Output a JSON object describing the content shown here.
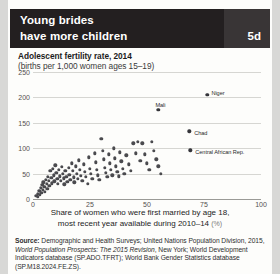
{
  "header": {
    "title": "Young brides\nhave more children",
    "badge": "5d",
    "bg_color": "#231f20",
    "badge_bg_color": "#393536"
  },
  "chart_data": {
    "type": "scatter",
    "title": "Adolescent fertility rate, 2014",
    "subtitle": "(births per 1,000 women ages 15–19)",
    "xlabel": "Share of women who were first married by age 18,",
    "xlabel_line2": "most recent year available during 2010–14",
    "xlabel_unit": "(%)",
    "ylabel": "",
    "xlim": [
      0,
      100
    ],
    "ylim": [
      0,
      250
    ],
    "xticks": [
      "0",
      "25",
      "50",
      "75",
      "100"
    ],
    "xtick_values": [
      0,
      25,
      50,
      75,
      100
    ],
    "yticks": [
      "0",
      "50",
      "100",
      "150",
      "200",
      "250"
    ],
    "ytick_values": [
      0,
      50,
      100,
      150,
      200,
      250
    ],
    "grid": true,
    "legend": "none",
    "marker_color": "#4a4a4e",
    "points": [
      [
        1.5,
        6
      ],
      [
        2.0,
        10
      ],
      [
        2.2,
        4
      ],
      [
        2.8,
        16
      ],
      [
        3.0,
        8
      ],
      [
        3.4,
        22
      ],
      [
        3.6,
        12
      ],
      [
        4.0,
        28
      ],
      [
        4.2,
        18
      ],
      [
        4.6,
        33
      ],
      [
        5.0,
        24
      ],
      [
        5.2,
        14
      ],
      [
        5.6,
        38
      ],
      [
        6.0,
        30
      ],
      [
        6.2,
        20
      ],
      [
        6.6,
        44
      ],
      [
        7.0,
        36
      ],
      [
        7.2,
        26
      ],
      [
        7.6,
        56
      ],
      [
        8.0,
        42
      ],
      [
        8.2,
        31
      ],
      [
        8.6,
        60
      ],
      [
        9.0,
        47
      ],
      [
        9.4,
        35
      ],
      [
        9.8,
        66
      ],
      [
        10.2,
        52
      ],
      [
        10.6,
        40
      ],
      [
        11.0,
        30
      ],
      [
        11.4,
        58
      ],
      [
        11.8,
        45
      ],
      [
        12.2,
        36
      ],
      [
        12.6,
        63
      ],
      [
        13.0,
        50
      ],
      [
        13.4,
        41
      ],
      [
        13.8,
        29
      ],
      [
        14.2,
        55
      ],
      [
        14.6,
        44
      ],
      [
        15.0,
        34
      ],
      [
        15.6,
        62
      ],
      [
        16.0,
        48
      ],
      [
        16.4,
        38
      ],
      [
        17.0,
        70
      ],
      [
        17.4,
        56
      ],
      [
        17.8,
        43
      ],
      [
        18.2,
        33
      ],
      [
        18.8,
        64
      ],
      [
        19.2,
        50
      ],
      [
        19.6,
        40
      ],
      [
        20.2,
        76
      ],
      [
        20.6,
        58
      ],
      [
        21.0,
        46
      ],
      [
        21.6,
        36
      ],
      [
        22.2,
        68
      ],
      [
        22.8,
        54
      ],
      [
        23.2,
        44
      ],
      [
        24.0,
        30
      ],
      [
        24.6,
        82
      ],
      [
        25.0,
        60
      ],
      [
        25.4,
        50
      ],
      [
        26.0,
        40
      ],
      [
        27.0,
        90
      ],
      [
        27.6,
        72
      ],
      [
        28.0,
        58
      ],
      [
        28.4,
        47
      ],
      [
        29.0,
        38
      ],
      [
        30.0,
        118
      ],
      [
        30.6,
        95
      ],
      [
        31.0,
        78
      ],
      [
        31.6,
        62
      ],
      [
        32.0,
        52
      ],
      [
        32.6,
        44
      ],
      [
        33.2,
        88
      ],
      [
        33.8,
        70
      ],
      [
        34.2,
        57
      ],
      [
        34.8,
        47
      ],
      [
        35.4,
        100
      ],
      [
        36.0,
        80
      ],
      [
        36.4,
        64
      ],
      [
        37.0,
        54
      ],
      [
        37.6,
        45
      ],
      [
        38.2,
        92
      ],
      [
        38.8,
        74
      ],
      [
        39.4,
        60
      ],
      [
        40.0,
        50
      ],
      [
        41.0,
        86
      ],
      [
        42.0,
        68
      ],
      [
        43.0,
        56
      ],
      [
        44.0,
        110
      ],
      [
        45.0,
        90
      ],
      [
        46.0,
        112
      ],
      [
        47.0,
        75
      ],
      [
        48.0,
        110
      ],
      [
        49.0,
        88
      ],
      [
        50.0,
        70
      ],
      [
        51.0,
        58
      ],
      [
        52.0,
        112
      ],
      [
        53.0,
        95
      ],
      [
        54.0,
        78
      ],
      [
        55.0,
        64
      ],
      [
        56.0,
        50
      ]
    ],
    "labeled_points": [
      {
        "name": "Niger",
        "x": 76.5,
        "y": 205,
        "label_dx": 4,
        "label_dy": -5
      },
      {
        "name": "Mali",
        "x": 55.0,
        "y": 175,
        "label_dx": -3,
        "label_dy": -8
      },
      {
        "name": "Chad",
        "x": 68.5,
        "y": 133,
        "label_dx": 5,
        "label_dy": -1.5
      },
      {
        "name": "Central African Rep.",
        "x": 69.0,
        "y": 96,
        "label_dx": 5,
        "label_dy": -1.5
      }
    ]
  },
  "source": {
    "label": "Source:",
    "text": " Demographic and Health Surveys; United Nations Population Division, 2015, ",
    "italic_1": "World Population Prospects: The 2015 Revision",
    "text_2": ", New York; World Development Indicators database (SP.ADO.TFRT); World Bank Gender Statistics database (SP.M18.2024.FE.ZS)."
  }
}
